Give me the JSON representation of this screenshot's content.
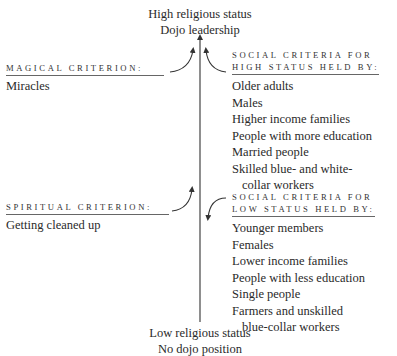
{
  "top": {
    "line1": "High religious status",
    "line2": "Dojo leadership"
  },
  "bottom": {
    "line1": "Low religious status",
    "line2": "No dojo position"
  },
  "magical": {
    "heading": "MAGICAL CRITERION:",
    "items": [
      "Miracles"
    ]
  },
  "spiritual": {
    "heading": "SPIRITUAL CRITERION:",
    "items": [
      "Getting cleaned up"
    ]
  },
  "high_status": {
    "heading_line1": "SOCIAL CRITERIA FOR",
    "heading_line2": "HIGH STATUS HELD BY:",
    "items": [
      "Older adults",
      "Males",
      "Higher income families",
      "People with more education",
      "Married people",
      "Skilled blue- and white-",
      "collar workers"
    ]
  },
  "low_status": {
    "heading_line1": "SOCIAL CRITERIA FOR",
    "heading_line2": "LOW STATUS HELD BY:",
    "items": [
      "Younger members",
      "Females",
      "Lower income families",
      "People with less education",
      "Single people",
      "Farmers and unskilled",
      "blue-collar workers"
    ]
  }
}
